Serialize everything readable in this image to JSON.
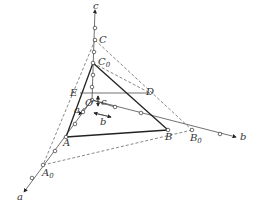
{
  "diagram": {
    "type": "crystal axes with intercept plane",
    "axes": {
      "a": "a",
      "b": "b",
      "c": "c"
    },
    "points": {
      "A": "A",
      "A0": "A",
      "A0_sub": "0",
      "B": "B",
      "B0": "B",
      "B0_sub": "0",
      "C": "C",
      "C0": "C",
      "C0_sub": "0",
      "D": "D",
      "E": "E",
      "O": "O"
    },
    "unit_labels": {
      "a_unit": "a",
      "b_unit": "b",
      "c_unit": "c"
    },
    "colors": {
      "line": "#222222",
      "dashed": "#555555",
      "text": "#333333"
    }
  }
}
